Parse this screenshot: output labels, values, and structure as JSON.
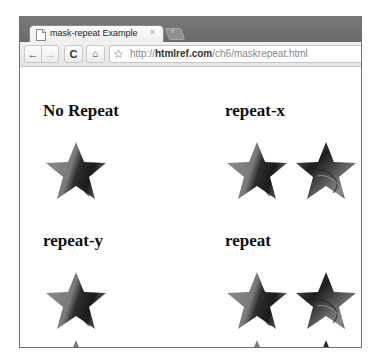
{
  "browser": {
    "tab": {
      "title": "mask-repeat Example",
      "close_icon": "×",
      "page_icon": "document-icon"
    },
    "new_tab_label": "+",
    "toolbar": {
      "back_icon": "←",
      "forward_icon": "→",
      "reload_icon": "C",
      "home_icon": "⌂",
      "bookmark_icon": "☆"
    },
    "url": {
      "prefix": "http://",
      "host": "htmlref.com",
      "path": "/ch6/maskrepeat.html"
    }
  },
  "page": {
    "sections": [
      {
        "heading": "No Repeat",
        "mode": "no-repeat"
      },
      {
        "heading": "repeat-x",
        "mode": "repeat-x"
      },
      {
        "heading": "repeat-y",
        "mode": "repeat-y"
      },
      {
        "heading": "repeat",
        "mode": "repeat"
      }
    ]
  },
  "colors": {
    "frame": "#6e6e6e",
    "tabstrip": "#707070",
    "toolbar": "#e8e8e8",
    "star_light": "#9a9a9a",
    "star_dark": "#2a2a2a"
  }
}
